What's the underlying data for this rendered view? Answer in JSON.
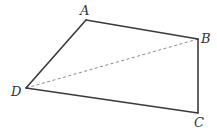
{
  "figure": {
    "type": "quadrilateral",
    "vertices": [
      {
        "name": "A",
        "x": 86,
        "y": 20,
        "label_x": 80,
        "label_y": 15
      },
      {
        "name": "B",
        "x": 198,
        "y": 39,
        "label_x": 201,
        "label_y": 43
      },
      {
        "name": "C",
        "x": 198,
        "y": 113,
        "label_x": 194,
        "label_y": 127
      },
      {
        "name": "D",
        "x": 26,
        "y": 88,
        "label_x": 11,
        "label_y": 96
      }
    ],
    "edges": [
      {
        "from": "A",
        "to": "B",
        "style": "solid"
      },
      {
        "from": "B",
        "to": "C",
        "style": "solid"
      },
      {
        "from": "C",
        "to": "D",
        "style": "solid"
      },
      {
        "from": "D",
        "to": "A",
        "style": "solid"
      },
      {
        "from": "D",
        "to": "B",
        "style": "dashed"
      }
    ],
    "labels": {
      "A": "A",
      "B": "B",
      "C": "C",
      "D": "D"
    },
    "colors": {
      "edge": "#3a3a3a",
      "diagonal": "#8a8a8a",
      "label": "#333333",
      "background": "#ffffff"
    }
  }
}
